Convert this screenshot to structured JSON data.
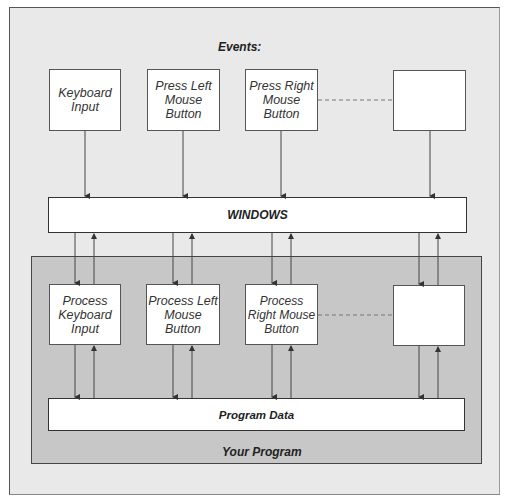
{
  "diagram": {
    "events_label": "Events:",
    "event_boxes": [
      {
        "id": "keyboard-input",
        "label": "Keyboard Input"
      },
      {
        "id": "press-left-mouse-button",
        "label": "Press Left Mouse Button"
      },
      {
        "id": "press-right-mouse-button",
        "label": "Press Right Mouse Button"
      },
      {
        "id": "empty-event",
        "label": ""
      }
    ],
    "windows_label": "WINDOWS",
    "program_label": "Your Program",
    "handler_boxes": [
      {
        "id": "process-keyboard-input",
        "label": "Process Keyboard Input"
      },
      {
        "id": "process-left-mouse-button",
        "label": "Process Left Mouse Button"
      },
      {
        "id": "process-right-mouse-button",
        "label": "Process Right Mouse Button"
      },
      {
        "id": "empty-handler",
        "label": ""
      }
    ],
    "program_data_label": "Program Data",
    "colors": {
      "frame_bg": "#e9e9e9",
      "panel_bg": "#c7c7c7",
      "box_bg": "#ffffff",
      "line": "#444444"
    }
  }
}
